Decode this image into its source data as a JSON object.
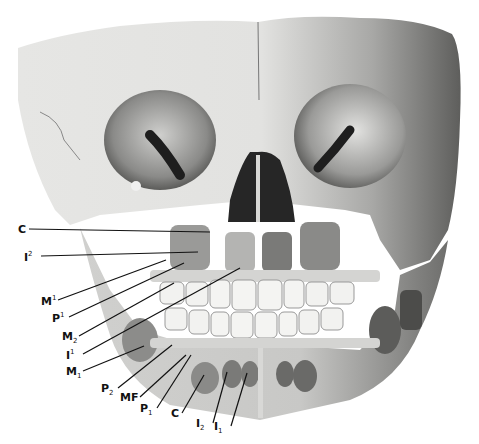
{
  "figure": {
    "colors": {
      "background": "#ffffff",
      "bone_light": "#e8e8e6",
      "bone_mid": "#bdbdbb",
      "bone_dark": "#6a6a68",
      "cavity": "#222222",
      "tooth": "#f4f4f2",
      "label_text": "#111111",
      "leader_line": "#111111"
    },
    "labels": [
      {
        "id": "C_upper",
        "base": "C",
        "mark": "",
        "mark_type": "",
        "x": 18,
        "y": 224,
        "target": [
          210,
          232
        ]
      },
      {
        "id": "I2_upper",
        "base": "I",
        "mark": "2",
        "mark_type": "sup",
        "x": 24,
        "y": 251,
        "target": [
          198,
          252
        ]
      },
      {
        "id": "M1_upper",
        "base": "M",
        "mark": "1",
        "mark_type": "sup",
        "x": 41,
        "y": 295,
        "target": [
          166,
          260
        ]
      },
      {
        "id": "P1_upper",
        "base": "P",
        "mark": "1",
        "mark_type": "sup",
        "x": 52,
        "y": 312,
        "target": [
          184,
          263
        ]
      },
      {
        "id": "M2_lower",
        "base": "M",
        "mark": "2",
        "mark_type": "sub",
        "x": 62,
        "y": 331,
        "target": [
          174,
          283
        ]
      },
      {
        "id": "I1_upper",
        "base": "I",
        "mark": "1",
        "mark_type": "sup",
        "x": 66,
        "y": 349,
        "target": [
          240,
          268
        ]
      },
      {
        "id": "M1_lower",
        "base": "M",
        "mark": "1",
        "mark_type": "sub",
        "x": 66,
        "y": 366,
        "target": [
          144,
          346
        ]
      },
      {
        "id": "P2_lower",
        "base": "P",
        "mark": "2",
        "mark_type": "sub",
        "x": 101,
        "y": 383,
        "target": [
          172,
          345
        ]
      },
      {
        "id": "MF",
        "base": "MF",
        "mark": "",
        "mark_type": "",
        "x": 120,
        "y": 392,
        "target": [
          186,
          355
        ]
      },
      {
        "id": "P1_lower",
        "base": "P",
        "mark": "1",
        "mark_type": "sub",
        "x": 140,
        "y": 403,
        "target": [
          191,
          355
        ]
      },
      {
        "id": "C_lower",
        "base": "C",
        "mark": "",
        "mark_type": "",
        "x": 171,
        "y": 408,
        "target": [
          204,
          375
        ]
      },
      {
        "id": "I2_lower",
        "base": "I",
        "mark": "2",
        "mark_type": "sub",
        "x": 196,
        "y": 418,
        "target": [
          227,
          372
        ]
      },
      {
        "id": "I1_lower",
        "base": "I",
        "mark": "1",
        "mark_type": "sub",
        "x": 214,
        "y": 421,
        "target": [
          247,
          373
        ]
      }
    ]
  }
}
